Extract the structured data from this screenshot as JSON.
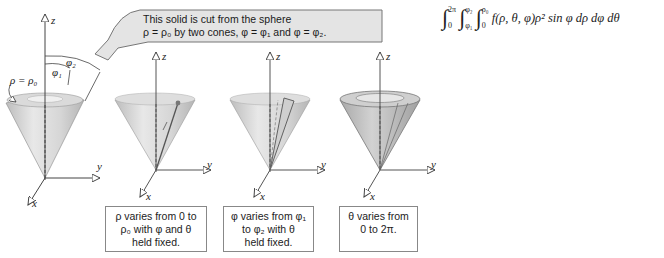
{
  "callout": {
    "line1": "This solid is cut from the sphere",
    "line2": "ρ = ρ₀ by two cones, φ = φ₁ and φ = φ₂."
  },
  "integral": {
    "text": "∫₀^{2π} ∫_{φ₁}^{φ₂} ∫₀^{ρ₀} f(ρ, θ, φ)ρ² sin φ dρ dφ dθ",
    "outer": {
      "lower": "0",
      "upper": "2π"
    },
    "middle": {
      "lower": "φ₁",
      "upper": "φ₂"
    },
    "inner": {
      "lower": "0",
      "upper": "ρ₀"
    },
    "integrand": "f(ρ, θ, φ)ρ² sin φ dρ dφ dθ"
  },
  "labels": {
    "rho_eq": "ρ = ρ₀",
    "phi1": "φ₁",
    "phi2": "φ₂",
    "z": "z",
    "y": "y",
    "x": "x"
  },
  "captions": [
    {
      "lines": [
        "ρ varies from 0 to",
        "ρ₀ with φ and θ",
        "held fixed."
      ]
    },
    {
      "lines": [
        "φ varies from φ₁",
        "to φ₂ with θ",
        "held fixed."
      ]
    },
    {
      "lines": [
        "θ varies from",
        "0 to 2π."
      ]
    }
  ],
  "colors": {
    "cone_light": "#e2e2e2",
    "cone_dark": "#a8a8a8",
    "callout_fill": "#e6e6e6",
    "axis": "#444444"
  }
}
